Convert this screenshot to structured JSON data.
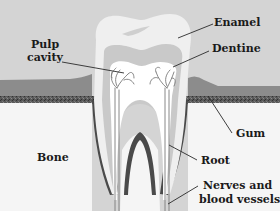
{
  "diagram": {
    "colors": {
      "background": "#d4d4d4",
      "gum": "#8c8c8c",
      "gum_edge": "#4a4a4a",
      "bone": "#f5f5f5",
      "enamel": "#efefef",
      "dentine": "#c9c9c9",
      "pulp": "#ffffff",
      "nerves": "#7a7a7a",
      "text": "#1a1a1a"
    },
    "labels": {
      "pulp_line1": "Pulp",
      "pulp_line2": "cavity",
      "enamel": "Enamel",
      "dentine": "Dentine",
      "gum": "Gum",
      "bone": "Bone",
      "root": "Root",
      "nerves_line1": "Nerves and",
      "nerves_line2": "blood vessels"
    }
  }
}
